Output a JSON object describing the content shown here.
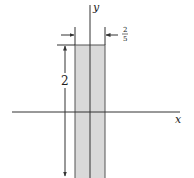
{
  "diagram": {
    "axes": {
      "x_label": "x",
      "y_label": "y"
    },
    "strip": {
      "height_label": "2",
      "width_label_numerator": "2",
      "width_label_denominator": "5",
      "fill": "#d9d9d9",
      "stroke": "#444444"
    },
    "colors": {
      "line": "#333333",
      "background": "#ffffff"
    }
  }
}
